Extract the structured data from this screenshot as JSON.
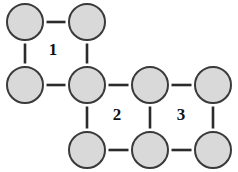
{
  "figure": {
    "width": 238,
    "height": 172,
    "background_color": "#ffffff"
  },
  "style": {
    "vertex_fill": "#d9d9d9",
    "vertex_stroke": "#3a3a3a",
    "vertex_stroke_width": 2,
    "vertex_radius": 18,
    "edge_color": "#2b2b2b",
    "edge_width": 2.6,
    "label_color": "#111111"
  },
  "chart_data": {
    "type": "diagram",
    "xlabel": "",
    "ylabel": "",
    "vertices": [
      {
        "id": "v1",
        "name": "top-left",
        "x": 25,
        "y": 22,
        "row": "top",
        "col": 1
      },
      {
        "id": "v2",
        "name": "top-second",
        "x": 87,
        "y": 22,
        "row": "top",
        "col": 2
      },
      {
        "id": "v3",
        "name": "middle-first",
        "x": 25,
        "y": 85,
        "row": "middle",
        "col": 1
      },
      {
        "id": "v4",
        "name": "middle-second",
        "x": 87,
        "y": 85,
        "row": "middle",
        "col": 2
      },
      {
        "id": "v5",
        "name": "middle-third",
        "x": 150,
        "y": 85,
        "row": "middle",
        "col": 3
      },
      {
        "id": "v6",
        "name": "middle-fourth",
        "x": 213,
        "y": 85,
        "row": "middle",
        "col": 4
      },
      {
        "id": "v7",
        "name": "bottom-second",
        "x": 87,
        "y": 150,
        "row": "bottom",
        "col": 2
      },
      {
        "id": "v8",
        "name": "bottom-third",
        "x": 150,
        "y": 150,
        "row": "bottom",
        "col": 3
      },
      {
        "id": "v9",
        "name": "bottom-fourth",
        "x": 213,
        "y": 150,
        "row": "bottom",
        "col": 4
      }
    ],
    "edges": [
      {
        "id": "e1",
        "from": "v1",
        "to": "v2",
        "orientation": "horizontal"
      },
      {
        "id": "e2",
        "from": "v1",
        "to": "v3",
        "orientation": "vertical"
      },
      {
        "id": "e3",
        "from": "v2",
        "to": "v4",
        "orientation": "vertical"
      },
      {
        "id": "e4",
        "from": "v3",
        "to": "v4",
        "orientation": "horizontal"
      },
      {
        "id": "e5",
        "from": "v4",
        "to": "v5",
        "orientation": "horizontal"
      },
      {
        "id": "e6",
        "from": "v5",
        "to": "v6",
        "orientation": "horizontal"
      },
      {
        "id": "e7",
        "from": "v4",
        "to": "v7",
        "orientation": "vertical"
      },
      {
        "id": "e8",
        "from": "v5",
        "to": "v8",
        "orientation": "vertical"
      },
      {
        "id": "e9",
        "from": "v6",
        "to": "v9",
        "orientation": "vertical"
      },
      {
        "id": "e10",
        "from": "v7",
        "to": "v8",
        "orientation": "horizontal"
      },
      {
        "id": "e11",
        "from": "v8",
        "to": "v9",
        "orientation": "horizontal"
      }
    ],
    "region_labels": [
      {
        "id": "r1",
        "text": "1",
        "x": 53,
        "y": 51,
        "bounded_by": [
          "v1",
          "v2",
          "v4",
          "v3"
        ]
      },
      {
        "id": "r2",
        "text": "2",
        "x": 117,
        "y": 116,
        "bounded_by": [
          "v4",
          "v5",
          "v8",
          "v7"
        ]
      },
      {
        "id": "r3",
        "text": "3",
        "x": 181,
        "y": 116,
        "bounded_by": [
          "v5",
          "v6",
          "v9",
          "v8"
        ]
      }
    ],
    "counts": {
      "vertices": 9,
      "edges": 11,
      "labeled_regions": 3
    }
  }
}
